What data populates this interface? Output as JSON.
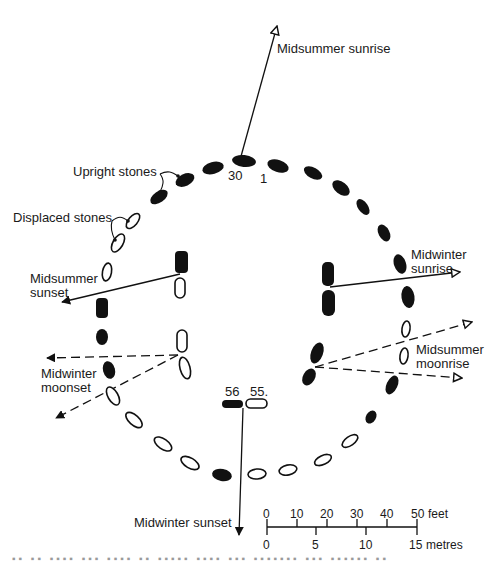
{
  "figure": {
    "type": "stone-circle-alignment-plan",
    "colors": {
      "ink": "#111111",
      "paper": "#ffffff",
      "caption_fade": "#9a9a9a"
    }
  },
  "labels": {
    "midsummer_sunrise": "Midsummer sunrise",
    "upright_stones": "Upright stones",
    "displaced_stones": "Displaced stones",
    "midsummer_sunset_1": "Midsummer",
    "midsummer_sunset_2": "sunset",
    "midwinter_sunrise_1": "Midwinter",
    "midwinter_sunrise_2": "sunrise",
    "midwinter_moonset_1": "Midwinter",
    "midwinter_moonset_2": "moonset",
    "midsummer_moonrise_1": "Midsummer",
    "midsummer_moonrise_2": "moonrise",
    "midwinter_sunset": "Midwinter sunset"
  },
  "stone_numbers": {
    "n30": "30",
    "n1": "1",
    "n56": "56",
    "n55": "55."
  },
  "scale_bar": {
    "feet_ticks": [
      "0",
      "10",
      "20",
      "30",
      "40",
      "50"
    ],
    "feet_unit": "feet",
    "metre_ticks": [
      "0",
      "5",
      "10",
      "15"
    ],
    "metre_unit": "metres"
  },
  "legend": {
    "upright": "filled black stone",
    "displaced": "outlined white stone"
  }
}
